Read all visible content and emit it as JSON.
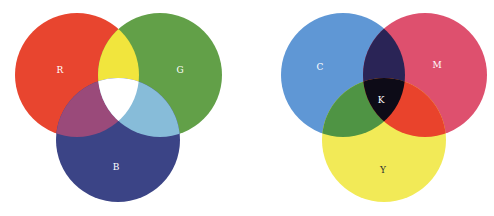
{
  "rgb_diagram": {
    "title": "Additive color (RGB)",
    "circles": [
      {
        "label": "R",
        "color": "#e8452f",
        "cx": 77,
        "cy": 75,
        "r": 62,
        "label_x": 60,
        "label_y": 70
      },
      {
        "label": "G",
        "color": "#62a048",
        "cx": 160,
        "cy": 75,
        "r": 62,
        "label_x": 180,
        "label_y": 70
      },
      {
        "label": "B",
        "color": "#3b4486",
        "cx": 118,
        "cy": 140,
        "r": 62,
        "label_x": 116,
        "label_y": 167
      }
    ],
    "overlaps": {
      "rg": "#f1e53d",
      "rb": "#9a4a7a",
      "gb": "#87bcd9",
      "rgb": "#ffffff"
    }
  },
  "cmy_diagram": {
    "title": "Subtractive color (CMYK)",
    "circles": [
      {
        "label": "C",
        "color": "#5f97d5",
        "cx": 343,
        "cy": 75,
        "r": 62,
        "label_x": 320,
        "label_y": 67
      },
      {
        "label": "M",
        "color": "#de506e",
        "cx": 425,
        "cy": 75,
        "r": 62,
        "label_x": 437,
        "label_y": 65
      },
      {
        "label": "Y",
        "color": "#f2ea57",
        "cx": 384,
        "cy": 140,
        "r": 62,
        "label_x": 383,
        "label_y": 170
      }
    ],
    "overlaps": {
      "cm": "#2a2456",
      "cy": "#4f9444",
      "my": "#e9432c",
      "cmy": "#0d0b17"
    },
    "center_label": {
      "label": "K",
      "x": 381,
      "y": 100
    }
  },
  "label_color": "#ffffff",
  "label_color_dark": "#333333"
}
